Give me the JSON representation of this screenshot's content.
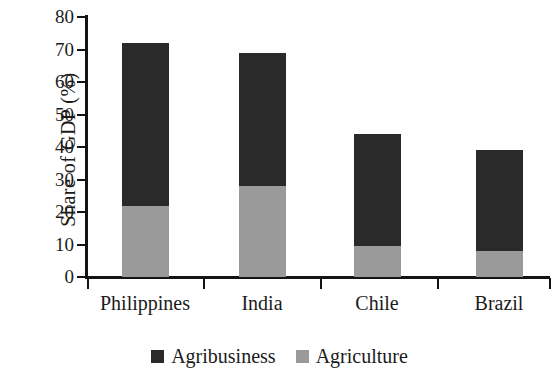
{
  "chart_data": {
    "type": "bar",
    "subtype": "stacked",
    "title": "",
    "xlabel": "",
    "ylabel": "Share of GDP (%)",
    "ylim": [
      0,
      80
    ],
    "yticks": [
      0,
      10,
      20,
      30,
      40,
      50,
      60,
      70,
      80
    ],
    "ytick_labels": [
      "0",
      "10",
      "20",
      "30",
      "40",
      "50",
      "60",
      "70",
      "80"
    ],
    "grid": false,
    "legend_position": "bottom-center",
    "categories": [
      "Philippines",
      "India",
      "Chile",
      "Brazil"
    ],
    "series": [
      {
        "name": "Agriculture",
        "color": "#9a9a9a",
        "values": [
          22,
          28,
          9.5,
          8
        ]
      },
      {
        "name": "Agribusiness",
        "color": "#2a2a2a",
        "values": [
          50,
          41,
          34.5,
          31
        ]
      }
    ],
    "totals": [
      72,
      69,
      44,
      39
    ],
    "stack_order": [
      "Agriculture",
      "Agribusiness"
    ]
  },
  "legend": {
    "items": [
      {
        "label": "Agribusiness",
        "color": "#2a2a2a"
      },
      {
        "label": "Agriculture",
        "color": "#9a9a9a"
      }
    ]
  },
  "colors": {
    "agribusiness": "#2a2a2a",
    "agriculture": "#9a9a9a",
    "axis": "#141414",
    "text": "#1b1b1b",
    "background": "#ffffff"
  }
}
